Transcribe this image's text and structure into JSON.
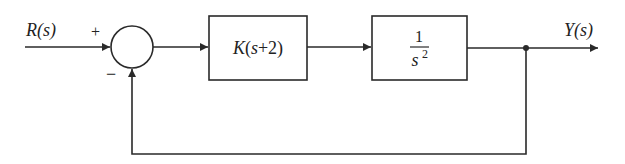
{
  "diagram": {
    "type": "feedback-control-block-diagram",
    "input": {
      "label": "R(s)"
    },
    "output": {
      "label": "Y(s)"
    },
    "summing_junction": {
      "plus_sign": "+",
      "minus_sign": "−"
    },
    "blocks": [
      {
        "id": "controller",
        "label": "K(s+2)"
      },
      {
        "id": "plant",
        "numerator": "1",
        "denominator_base": "s",
        "denominator_exp": "2"
      }
    ],
    "feedback": {
      "type": "unity",
      "sign": "negative"
    },
    "colors": {
      "line": "#2a2a2a",
      "background": "#ffffff"
    }
  }
}
